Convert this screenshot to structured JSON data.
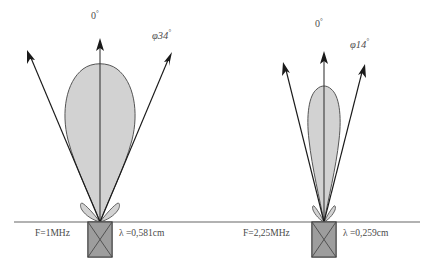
{
  "figure": {
    "type": "ultrasound-beam-divergence-diagram",
    "background_color": "#ffffff",
    "lobe_fill_color": "#d2d2d2",
    "lobe_stroke_color": "#555555",
    "transducer_fill_color": "#9d9d9d",
    "baseline_color": "#666666",
    "line_color": "#1a1a1a",
    "degree_symbol": "°",
    "phi_symbol": "φ",
    "lambda_symbol": "λ"
  },
  "panels": [
    {
      "id": "left",
      "axis_label": "0",
      "axis_label_unit": "°",
      "angle_label": "φ34",
      "angle_label_unit": "°",
      "frequency_label": "F=1MHz",
      "wavelength_label": "λ =0,581cm",
      "beam_half_angle_deg": 34,
      "frequency_mhz": 1,
      "wavelength_cm": 0.581
    },
    {
      "id": "right",
      "axis_label": "0",
      "axis_label_unit": "°",
      "angle_label": "φ14",
      "angle_label_unit": "°",
      "frequency_label": "F=2,25MHz",
      "wavelength_label": "λ =0,259cm",
      "beam_half_angle_deg": 14,
      "frequency_mhz": 2.25,
      "wavelength_cm": 0.259
    }
  ]
}
